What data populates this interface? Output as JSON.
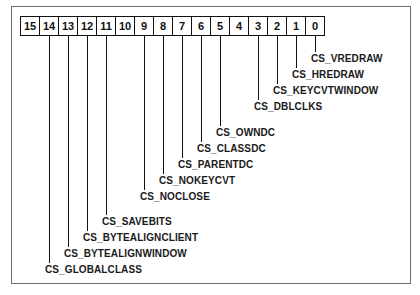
{
  "bits": [
    "15",
    "14",
    "13",
    "12",
    "11",
    "10",
    "9",
    "8",
    "7",
    "6",
    "5",
    "4",
    "3",
    "2",
    "1",
    "0"
  ],
  "flags": [
    {
      "bit": 0,
      "name": "CS_VREDRAW",
      "label_y": 53
    },
    {
      "bit": 1,
      "name": "CS_HREDRAW",
      "label_y": 69
    },
    {
      "bit": 2,
      "name": "CS_KEYCVTWINDOW",
      "label_y": 85
    },
    {
      "bit": 3,
      "name": "CS_DBLCLKS",
      "label_y": 101
    },
    {
      "bit": 5,
      "name": "CS_OWNDC",
      "label_y": 127
    },
    {
      "bit": 6,
      "name": "CS_CLASSDC",
      "label_y": 143
    },
    {
      "bit": 7,
      "name": "CS_PARENTDC",
      "label_y": 159
    },
    {
      "bit": 8,
      "name": "CS_NOKEYCVT",
      "label_y": 175
    },
    {
      "bit": 9,
      "name": "CS_NOCLOSE",
      "label_y": 191
    },
    {
      "bit": 11,
      "name": "CS_SAVEBITS",
      "label_y": 216
    },
    {
      "bit": 12,
      "name": "CS_BYTEALIGNCLIENT",
      "label_y": 232
    },
    {
      "bit": 13,
      "name": "CS_BYTEALIGNWINDOW",
      "label_y": 248
    },
    {
      "bit": 14,
      "name": "CS_GLOBALCLASS",
      "label_y": 264
    }
  ]
}
